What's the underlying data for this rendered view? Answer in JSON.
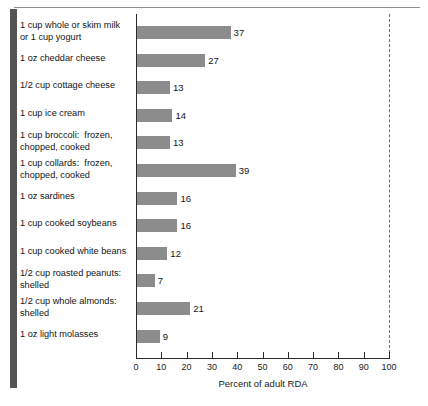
{
  "figure": {
    "axis_title": "Percent of adult RDA",
    "bar_color": "#8c8c8c",
    "axis_color": "#2b2b2b",
    "reference_line_value": 100
  },
  "chart_data": {
    "type": "bar",
    "orientation": "horizontal",
    "title": "",
    "subtitle": "",
    "xlabel": "Percent of adult RDA",
    "ylabel": "",
    "xlim": [
      0,
      100
    ],
    "ylim": null,
    "grid": false,
    "legend": null,
    "tick_labels": [
      "0",
      "10",
      "20",
      "30",
      "40",
      "50",
      "60",
      "70",
      "80",
      "90",
      "100"
    ],
    "ticks": [
      0,
      10,
      20,
      30,
      40,
      50,
      60,
      70,
      80,
      90,
      100
    ],
    "annotations": [
      {
        "type": "reference-line",
        "style": "dashed",
        "x": 100,
        "label": ""
      }
    ],
    "categories": [
      "1 cup whole or skim milk\nor 1 cup yogurt",
      "1 oz cheddar cheese",
      "1/2 cup cottage cheese",
      "1 cup ice cream",
      "1 cup broccoli:  frozen,\nchopped, cooked",
      "1 cup collards:  frozen,\nchopped, cooked",
      "1 oz sardines",
      "1 cup cooked soybeans",
      "1 cup cooked white beans",
      "1/2 cup roasted peanuts:\nshelled",
      "1/2 cup whole almonds:\nshelled",
      "1 oz light molasses"
    ],
    "values": [
      37,
      27,
      13,
      14,
      13,
      39,
      16,
      16,
      12,
      7,
      21,
      9
    ],
    "value_labels": [
      "37",
      "27",
      "13",
      "14",
      "13",
      "39",
      "16",
      "16",
      "12",
      "7",
      "21",
      "9"
    ]
  }
}
